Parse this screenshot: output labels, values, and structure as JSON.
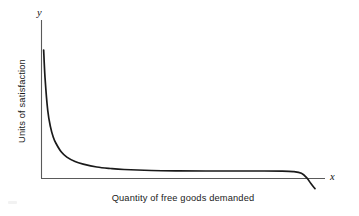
{
  "figure": {
    "background_color": "#ffffff",
    "axis_color": "#5a5a5a",
    "curve_color": "#1a1a1a"
  },
  "axes": {
    "y_variable_label": "y",
    "x_variable_label": "x",
    "y_axis_title": "Units of satisfaction",
    "x_axis_title": "Quantity of free goods demanded"
  },
  "chart_data": {
    "type": "line",
    "title": "",
    "subtitle": "",
    "xlabel": "Quantity of free goods demanded",
    "ylabel": "Units of satisfaction",
    "xlim": [
      0,
      100
    ],
    "ylim": [
      0,
      100
    ],
    "grid": false,
    "legend": "none",
    "tick_labels": {
      "x": [],
      "y": []
    },
    "annotations": [],
    "series": [
      {
        "name": "Units of satisfaction",
        "description": "Hyperbolic decay: satisfaction falls steeply from a high initial value, flattens just above zero across most of the range, then plunges below zero at the far right.",
        "x": [
          0.5,
          1,
          2,
          3,
          4,
          5,
          7,
          9,
          12,
          15,
          20,
          25,
          30,
          40,
          50,
          60,
          70,
          80,
          88,
          92,
          95,
          97,
          98.5,
          100
        ],
        "y": [
          100,
          78,
          52,
          39,
          31,
          26,
          19,
          15,
          11.5,
          9.5,
          7.2,
          6.0,
          5.2,
          4.4,
          4.1,
          4.0,
          4.0,
          4.0,
          3.9,
          3.5,
          2.2,
          -1.5,
          -6.0,
          -10.0
        ]
      }
    ]
  },
  "geometry": {
    "y_axis_x": 41,
    "y_axis_top_y": 20,
    "x_axis_y": 178,
    "x_axis_right_x": 325,
    "curve_start": [
      42,
      50
    ],
    "curve_flat_y": 171,
    "curve_end": [
      315,
      192
    ]
  }
}
